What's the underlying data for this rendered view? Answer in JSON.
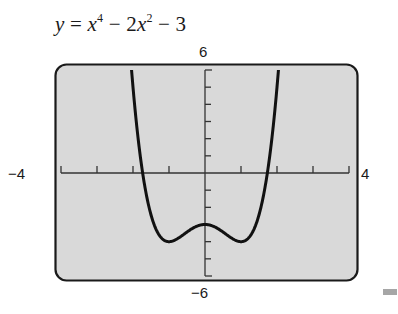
{
  "chart_data": {
    "type": "line",
    "title_parts": {
      "y": "y",
      "eq": " = ",
      "x1": "x",
      "exp1": "4",
      "mid": " − 2",
      "x2": "x",
      "exp2": "2",
      "tail": " − 3"
    },
    "function": "x^4 - 2x^2 - 3",
    "xlim": [
      -4,
      4
    ],
    "ylim": [
      -6,
      6
    ],
    "xlabel": "",
    "ylabel": "",
    "tick_labels": {
      "x_min": "−4",
      "x_max": "4",
      "y_min": "−6",
      "y_max": "6"
    },
    "x_ticks": [
      -3,
      -2,
      -1,
      1,
      2,
      3
    ],
    "y_ticks": [
      -5,
      -4,
      -3,
      -2,
      -1,
      1,
      2,
      3,
      4,
      5
    ],
    "grid": false,
    "legend": null,
    "key_points": [
      {
        "x": -1,
        "y": -4,
        "note": "local minimum"
      },
      {
        "x": 0,
        "y": -3,
        "note": "local maximum"
      },
      {
        "x": 1,
        "y": -4,
        "note": "local minimum"
      },
      {
        "x": -1.732,
        "y": 0,
        "note": "x-intercept"
      },
      {
        "x": 1.732,
        "y": 0,
        "note": "x-intercept"
      }
    ],
    "series": [
      {
        "name": "y = x^4 - 2x^2 - 3",
        "x": [
          -2.0,
          -1.9,
          -1.8,
          -1.7,
          -1.6,
          -1.5,
          -1.4,
          -1.3,
          -1.2,
          -1.1,
          -1.0,
          -0.9,
          -0.8,
          -0.7,
          -0.6,
          -0.5,
          -0.4,
          -0.3,
          -0.2,
          -0.1,
          0.0,
          0.1,
          0.2,
          0.3,
          0.4,
          0.5,
          0.6,
          0.7,
          0.8,
          0.9,
          1.0,
          1.1,
          1.2,
          1.3,
          1.4,
          1.5,
          1.6,
          1.7,
          1.8,
          1.9,
          2.0
        ],
        "values": [
          5.0,
          2.81,
          1.02,
          -0.43,
          -1.57,
          -2.44,
          -3.08,
          -3.52,
          -3.81,
          -3.96,
          -4.0,
          -3.96,
          -3.87,
          -3.74,
          -3.59,
          -3.44,
          -3.29,
          -3.17,
          -3.08,
          -3.02,
          -3.0,
          -3.02,
          -3.08,
          -3.17,
          -3.29,
          -3.44,
          -3.59,
          -3.74,
          -3.87,
          -3.96,
          -4.0,
          -3.96,
          -3.81,
          -3.52,
          -3.08,
          -2.44,
          -1.57,
          -0.43,
          1.02,
          2.81,
          5.0
        ]
      }
    ]
  },
  "style": {
    "panel_fill": "#d9d9d9",
    "frame_color": "#1a1a1a",
    "curve_color": "#111111",
    "axis_color": "#333333",
    "marker_color": "#a6a6a6"
  }
}
